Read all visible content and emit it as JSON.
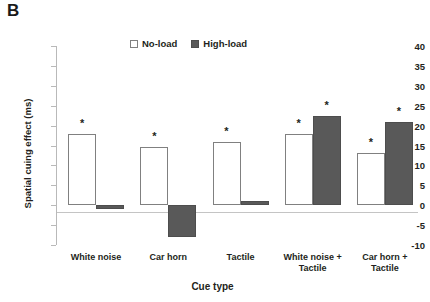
{
  "panel": {
    "label": "B"
  },
  "legend": {
    "items": [
      {
        "label": "No-load",
        "swatch": "open-square-icon",
        "color": "#ffffff"
      },
      {
        "label": "High-load",
        "swatch": "filled-square-icon",
        "color": "#595959"
      }
    ]
  },
  "axes": {
    "ylabel": "Spatial cuing effect (ms)",
    "xlabel": "Cue type",
    "yticks": [
      40,
      35,
      30,
      25,
      20,
      15,
      10,
      5,
      0,
      -5,
      -10
    ],
    "ytick_labels": [
      "40",
      "35",
      "30",
      "25",
      "20",
      "15",
      "10",
      "5",
      "0",
      "-5",
      "-10"
    ]
  },
  "significance_marker": "*",
  "chart_data": {
    "type": "bar",
    "title": "",
    "subtitle": "",
    "xlabel": "Cue type",
    "ylabel": "Spatial cuing effect (ms)",
    "ylim": [
      -10,
      40
    ],
    "ytick_step": 5,
    "grid": false,
    "legend_position": "top-center",
    "categories": [
      "White noise",
      "Car horn",
      "Tactile",
      "White noise + Tactile",
      "Car horn + Tactile"
    ],
    "category_lines": [
      [
        "White noise"
      ],
      [
        "Car horn"
      ],
      [
        "Tactile"
      ],
      [
        "White noise +",
        "Tactile"
      ],
      [
        "Car horn +",
        "Tactile"
      ]
    ],
    "series": [
      {
        "name": "No-load",
        "color": "#ffffff",
        "edge_color": "#808080",
        "values": [
          18,
          14.5,
          16,
          18,
          13
        ],
        "significant": [
          true,
          true,
          true,
          true,
          true
        ]
      },
      {
        "name": "High-load",
        "color": "#595959",
        "edge_color": "#4d4d4d",
        "values": [
          -1,
          -8,
          1,
          22.5,
          21
        ],
        "significant": [
          false,
          false,
          false,
          true,
          true
        ]
      }
    ],
    "annotations": [
      {
        "text": "*",
        "series": "No-load",
        "category": "White noise"
      },
      {
        "text": "*",
        "series": "No-load",
        "category": "Car horn"
      },
      {
        "text": "*",
        "series": "No-load",
        "category": "Tactile"
      },
      {
        "text": "*",
        "series": "No-load",
        "category": "White noise + Tactile"
      },
      {
        "text": "*",
        "series": "High-load",
        "category": "White noise + Tactile"
      },
      {
        "text": "*",
        "series": "No-load",
        "category": "Car horn + Tactile"
      },
      {
        "text": "*",
        "series": "High-load",
        "category": "Car horn + Tactile"
      }
    ]
  }
}
